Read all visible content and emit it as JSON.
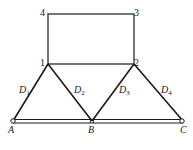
{
  "diagram": {
    "type": "truss",
    "stroke_color": "#1a1a1a",
    "nodes": {
      "n1": {
        "label": "1",
        "x": 48,
        "y": 64
      },
      "n2": {
        "label": "2",
        "x": 134,
        "y": 64
      },
      "n3": {
        "label": "3",
        "x": 134,
        "y": 14
      },
      "n4": {
        "label": "4",
        "x": 48,
        "y": 14
      },
      "A": {
        "label": "A",
        "x": 13,
        "y": 121
      },
      "B": {
        "label": "B",
        "x": 92,
        "y": 121
      },
      "C": {
        "label": "C",
        "x": 183,
        "y": 121
      }
    },
    "members": [
      {
        "id": "D1",
        "label": "D",
        "sub": "1",
        "from": "A",
        "to": "n1"
      },
      {
        "id": "D2",
        "label": "D",
        "sub": "2",
        "from": "n1",
        "to": "B"
      },
      {
        "id": "D3",
        "label": "D",
        "sub": "3",
        "from": "B",
        "to": "n2"
      },
      {
        "id": "D4",
        "label": "D",
        "sub": "4",
        "from": "n2",
        "to": "C"
      }
    ],
    "frame": [
      "n4",
      "n3",
      "n2",
      "n1"
    ],
    "bottom_chord": [
      "A",
      "B",
      "C"
    ]
  }
}
